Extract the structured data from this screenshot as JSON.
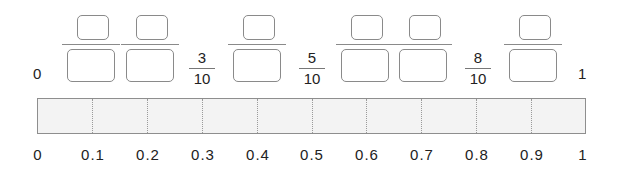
{
  "number_line_top": {
    "start_label": "0",
    "end_label": "1",
    "given_fractions": [
      {
        "position": 0.3,
        "numerator": "3",
        "denominator": "10"
      },
      {
        "position": 0.5,
        "numerator": "5",
        "denominator": "10"
      },
      {
        "position": 0.8,
        "numerator": "8",
        "denominator": "10"
      }
    ],
    "blank_fractions": [
      {
        "position": 0.1,
        "numerator": "",
        "denominator": ""
      },
      {
        "position": 0.2,
        "numerator": "",
        "denominator": ""
      },
      {
        "position": 0.4,
        "numerator": "",
        "denominator": ""
      },
      {
        "position": 0.6,
        "numerator": "",
        "denominator": ""
      },
      {
        "position": 0.7,
        "numerator": "",
        "denominator": ""
      },
      {
        "position": 0.9,
        "numerator": "",
        "denominator": ""
      }
    ]
  },
  "strip": {
    "divisions": 10,
    "fill_color": "#f3f3f3",
    "border_color": "#8e8e8e"
  },
  "decimal_scale": {
    "labels": [
      "0",
      "0.1",
      "0.2",
      "0.3",
      "0.4",
      "0.5",
      "0.6",
      "0.7",
      "0.8",
      "0.9",
      "1"
    ]
  }
}
